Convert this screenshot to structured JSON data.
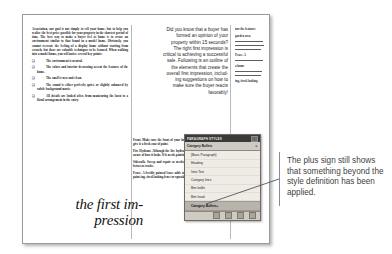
{
  "document": {
    "left_column": {
      "body": "Association, our goal is not simply to sell your home, but to help you realize the best price possible for your property in the shortest period of time. The best way to make a buyer feel at home is to create an environment similar to that found in a model home. Obviously, you cannot recreate the feeling of a display home without starting from scratch, but there are valuable techniques to be learned. When walking into a model home, you will notice several key points:",
      "bullets": [
        "The environment is neutral.",
        "The colors and interior decorating accent the features of the home.",
        "The smell is new and clean.",
        "The sound is either perfectly quiet, or slightly enhanced by subtle background music.",
        "All details are looked after, from manicuring the lawn to a floral arrangement in the entry."
      ],
      "bullet_marker": "❑"
    },
    "display_type": {
      "line1": "the first im-",
      "line2": "pression"
    },
    "middle_column": {
      "lines": [
        "Did you know that a buyer has",
        "formed an opinion of your",
        "property within 15 seconds?",
        "The right first impression is",
        "critical to achieving a successful",
        "sale. Following is an outline of",
        "the elements that create the",
        "overall first impression, includ-",
        "ing suggestions on how to",
        "make sure the buyer reacts",
        "favorably!"
      ]
    },
    "middle_lower_column": {
      "paragraphs": [
        {
          "runin": "Front.",
          "text": "Make sure the front of your home is free of clutter. If necessary, give it a fresh coat of paint."
        },
        {
          "runin": "Fire Hydrant.",
          "text": "Although the fire hydrant is not yours, you should still be aware of how it looks. If it needs painting, ask permission from your city."
        },
        {
          "runin": "Sidewalk.",
          "text": "Sweep and repair as needed and remove any weeds growing between cracks."
        },
        {
          "runin": "Fence.",
          "text": "A freshly painted fence adds to a home a crisp look. Never let a paint-ing, tired-looking fence or squeaky gate"
        }
      ]
    },
    "right_column": {
      "paragraphs": [
        "nor the features",
        "garden area",
        "Peace. A",
        "a home",
        "ing, tired-looking"
      ]
    }
  },
  "styles_panel": {
    "title": "PARAGRAPH STYLES",
    "header_label": "Category Bullets",
    "header_glyph": "⇅",
    "items": [
      {
        "label": "[Basic Paragraph]",
        "selected": false
      },
      {
        "label": "Heading",
        "selected": false
      },
      {
        "label": "Intro Text",
        "selected": false
      },
      {
        "label": "Category Intro",
        "selected": false
      },
      {
        "label": "Bim bullet",
        "selected": false
      },
      {
        "label": "Bim head",
        "selected": false
      },
      {
        "label": "Category Bullets+",
        "selected": true
      }
    ],
    "footer_icons": [
      "new-style-group-icon",
      "clear-overrides-icon",
      "new-style-icon",
      "delete-style-icon"
    ]
  },
  "callout": {
    "text": "The plus sign still shows that something beyond the style definition has been applied."
  },
  "colors": {
    "panel_background": "#d7d3cb",
    "panel_titlebar": "#3a3a3a",
    "selected_row": "#b9b4ab",
    "callout_text": "#3f3f41",
    "page_border": "#9a9a9a"
  }
}
